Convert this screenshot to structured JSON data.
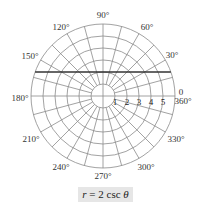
{
  "chart_data": {
    "type": "polar",
    "title": "r = 2 csc θ",
    "equation": "r = 2 csc θ",
    "curve": {
      "description": "horizontal line y = 2",
      "y_value": 2
    },
    "radial_ticks": [
      1,
      2,
      3,
      4,
      5
    ],
    "radial_max": 6,
    "ring_count": 6,
    "spoke_step_deg": 15,
    "angle_labels": [
      {
        "angle": 0,
        "label": "0"
      },
      {
        "angle": 0,
        "label": "360°"
      },
      {
        "angle": 30,
        "label": "30°"
      },
      {
        "angle": 60,
        "label": "60°"
      },
      {
        "angle": 90,
        "label": "90°"
      },
      {
        "angle": 120,
        "label": "120°"
      },
      {
        "angle": 150,
        "label": "150°"
      },
      {
        "angle": 180,
        "label": "180°"
      },
      {
        "angle": 210,
        "label": "210°"
      },
      {
        "angle": 240,
        "label": "240°"
      },
      {
        "angle": 270,
        "label": "270°"
      },
      {
        "angle": 300,
        "label": "300°"
      },
      {
        "angle": 330,
        "label": "330°"
      }
    ],
    "grid": true,
    "colors": {
      "grid": "#8a8a8a",
      "curve": "#333333",
      "caption_bg": "#e6e6e6"
    }
  },
  "caption": {
    "prefix": "r",
    "middle": " = 2 csc ",
    "suffix": "θ"
  },
  "labels": {
    "a0": "0",
    "a360": "360°",
    "a30": "30°",
    "a60": "60°",
    "a90": "90°",
    "a120": "120°",
    "a150": "150°",
    "a180": "180°",
    "a210": "210°",
    "a240": "240°",
    "a270": "270°",
    "a300": "300°",
    "a330": "330°",
    "t1": "1",
    "t2": "2",
    "t3": "3",
    "t4": "4",
    "t5": "5"
  }
}
